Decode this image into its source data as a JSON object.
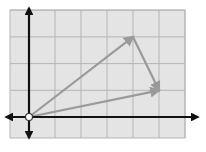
{
  "diagram": {
    "title": "",
    "grid": {
      "x_min": -1,
      "x_max": 6,
      "y_min": -1,
      "y_max": 4,
      "origin_px": [
        29,
        117
      ],
      "unit_px": [
        26,
        26.7
      ],
      "background": "#e4e4e4",
      "line_color": "#b5b5b5"
    },
    "axes": {
      "color": "#111111",
      "arrows": [
        "left",
        "right",
        "up",
        "down"
      ]
    },
    "origin_marker": {
      "x": 0,
      "y": 0,
      "fill": "#ffffff",
      "stroke": "#333333"
    },
    "vectors": [
      {
        "name": "vector-a",
        "from": [
          0,
          0
        ],
        "to": [
          4,
          3
        ],
        "color": "#9a9a9a"
      },
      {
        "name": "vector-b",
        "from": [
          0,
          0
        ],
        "to": [
          5,
          1
        ],
        "color": "#9a9a9a"
      },
      {
        "name": "vector-c",
        "from": [
          4,
          3
        ],
        "to": [
          5,
          1
        ],
        "color": "#9a9a9a"
      }
    ]
  }
}
